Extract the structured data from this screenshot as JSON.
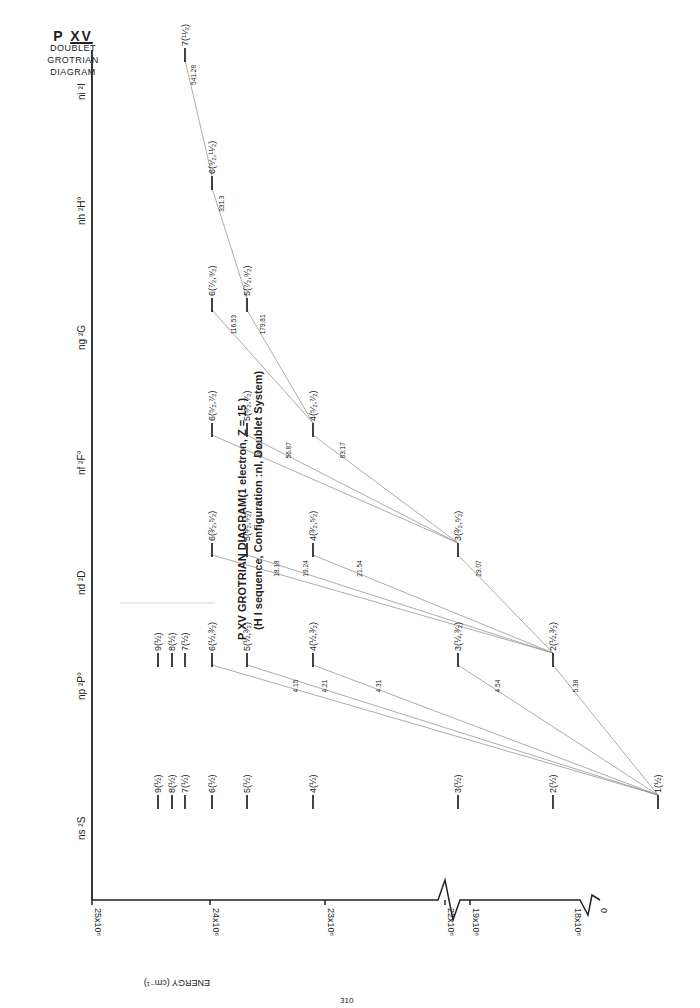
{
  "corner_label": {
    "element": "P",
    "ion": "XV",
    "line1": "DOUBLET",
    "line2": "GROTRIAN",
    "line3": "DIAGRAM"
  },
  "title": {
    "line1": "P XV GROTRIAN DIAGRAM(1 electron, Z = 15 )",
    "line2": "(H I sequence, Configuration :nl, Doublet System)"
  },
  "energy_axis": {
    "label": "ENERGY (cm⁻¹)",
    "ticks": [
      "25x10⁶",
      "24x10⁶",
      "23x10⁶",
      "22x10⁶",
      "19x10⁶",
      "18x10⁶",
      "0"
    ]
  },
  "series_headers": [
    "ns ²S",
    "np ²P°",
    "nd ²D",
    "nf ²F°",
    "ng ²G",
    "nh ²H°",
    "ni ²I"
  ],
  "chart_data": {
    "type": "grotrian",
    "ylabel": "ENERGY (cm^-1)",
    "y_ticks": [
      "0",
      "18x10^6",
      "19x10^6",
      "22x10^6",
      "23x10^6",
      "24x10^6",
      "25x10^6"
    ],
    "axis_breaks": [
      "between 0 and 18x10^6",
      "between 19x10^6 and 22x10^6"
    ],
    "columns": [
      "ns 2S",
      "np 2P°",
      "nd 2D",
      "nf 2F°",
      "ng 2G",
      "nh 2H°",
      "ni 2I"
    ],
    "levels": {
      "ns 2S": [
        "1(1/2)",
        "2(1/2)",
        "3(1/2)",
        "4(1/2)",
        "5(1/2)",
        "6(1/2)",
        "7(1/2)",
        "8(1/2)",
        "9(1/2)"
      ],
      "np 2P°": [
        "2(1/2,3/2)",
        "3(1/2,3/2)",
        "4(1/2,3/2)",
        "5(1/2,3/2)",
        "6(1/2,3/2)",
        "7(1/2)",
        "8(1/2)",
        "9(1/2)"
      ],
      "nd 2D": [
        "3(3/2,5/2)",
        "4(3/2,5/2)",
        "5(3/2,5/2)",
        "6(3/2,5/2)"
      ],
      "nf 2F°": [
        "4(5/2,7/2)",
        "5(5/2,7/2)",
        "6(5/2,7/2)"
      ],
      "ng 2G": [
        "5(7/2,9/2)",
        "6(7/2,9/2)"
      ],
      "nh 2H°": [
        "6(9/2,11/2)"
      ],
      "ni 2I": [
        "7(11/2)"
      ]
    },
    "transitions_wavelength_A": [
      {
        "from": "np 2",
        "to": "ns 1",
        "value": 5.38
      },
      {
        "from": "np 3",
        "to": "ns 2",
        "value": 4.54
      },
      {
        "from": "np 4",
        "to": "ns",
        "value": 4.31
      },
      {
        "from": "np 5",
        "to": "ns",
        "value": 4.21
      },
      {
        "from": "np 6",
        "to": "ns",
        "value": 4.15
      },
      {
        "from": "nd 3",
        "to": "np 2",
        "value": 29.07
      },
      {
        "from": "nd 4",
        "to": "np",
        "value": 21.54
      },
      {
        "from": "nd 5",
        "to": "np",
        "value": 19.24
      },
      {
        "from": "nd 6",
        "to": "np",
        "value": 18.18
      },
      {
        "from": "nf 4",
        "to": "nd 3",
        "value": 83.17
      },
      {
        "from": "nf 5",
        "to": "nd",
        "value": 56.87
      },
      {
        "from": "nf 6",
        "to": "nd",
        "value": 48.53
      },
      {
        "from": "ng 5",
        "to": "nf 4",
        "value": 179.81
      },
      {
        "from": "ng 6",
        "to": "nf",
        "value": 116.53
      },
      {
        "from": "nh 6",
        "to": "ng 5",
        "value": 331.3
      },
      {
        "from": "ni 7",
        "to": "nh 6",
        "value": 541.28
      }
    ]
  },
  "levels_view": [
    {
      "id": "s1",
      "x": 658,
      "y": 797,
      "label": "1(½)"
    },
    {
      "id": "s2",
      "x": 553,
      "y": 797,
      "label": "2(½)"
    },
    {
      "id": "s3",
      "x": 458,
      "y": 797,
      "label": "3(½)"
    },
    {
      "id": "s4",
      "x": 313,
      "y": 797,
      "label": "4(½)"
    },
    {
      "id": "s5",
      "x": 247,
      "y": 797,
      "label": "5(½)"
    },
    {
      "id": "s6",
      "x": 212,
      "y": 797,
      "label": "6(½)"
    },
    {
      "id": "s7",
      "x": 185,
      "y": 797,
      "label": "7(½)"
    },
    {
      "id": "s8",
      "x": 172,
      "y": 797,
      "label": "8(½)"
    },
    {
      "id": "s9",
      "x": 158,
      "y": 797,
      "label": "9(½)"
    },
    {
      "id": "p2",
      "x": 553,
      "y": 655,
      "label": "2(½,³⁄₂)"
    },
    {
      "id": "p3",
      "x": 458,
      "y": 655,
      "label": "3(½,³⁄₂)"
    },
    {
      "id": "p4",
      "x": 313,
      "y": 655,
      "label": "4(½,³⁄₂)"
    },
    {
      "id": "p5",
      "x": 247,
      "y": 655,
      "label": "5(½,³⁄₂)"
    },
    {
      "id": "p6",
      "x": 212,
      "y": 655,
      "label": "6(½,³⁄₂)"
    },
    {
      "id": "p7",
      "x": 185,
      "y": 655,
      "label": "7(½)"
    },
    {
      "id": "p8",
      "x": 172,
      "y": 655,
      "label": "8(½)"
    },
    {
      "id": "p9",
      "x": 158,
      "y": 655,
      "label": "9(½)"
    },
    {
      "id": "d3",
      "x": 458,
      "y": 545,
      "label": "3(³⁄₂,⁵⁄₂)"
    },
    {
      "id": "d4",
      "x": 313,
      "y": 545,
      "label": "4(³⁄₂,⁵⁄₂)"
    },
    {
      "id": "d5",
      "x": 247,
      "y": 545,
      "label": "5(³⁄₂,⁵⁄₂)"
    },
    {
      "id": "d6",
      "x": 212,
      "y": 545,
      "label": "6(³⁄₂,⁵⁄₂)"
    },
    {
      "id": "f4",
      "x": 313,
      "y": 425,
      "label": "4(⁵⁄₂,⁷⁄₂)"
    },
    {
      "id": "f5",
      "x": 247,
      "y": 425,
      "label": "5(⁵⁄₂,⁷⁄₂)"
    },
    {
      "id": "f6",
      "x": 212,
      "y": 425,
      "label": "6(⁵⁄₂,⁷⁄₂)"
    },
    {
      "id": "g5",
      "x": 247,
      "y": 300,
      "label": "5(⁷⁄₂,⁹⁄₂)"
    },
    {
      "id": "g6",
      "x": 212,
      "y": 300,
      "label": "6(⁷⁄₂,⁹⁄₂)"
    },
    {
      "id": "h6",
      "x": 212,
      "y": 178,
      "label": "6(⁹⁄₂,¹¹⁄₂)"
    },
    {
      "id": "i7",
      "x": 185,
      "y": 50,
      "label": "7(¹¹⁄₂)"
    }
  ],
  "transitions_view": [
    {
      "a": "p2",
      "b": "s1",
      "label": "5.38"
    },
    {
      "a": "p3",
      "b": "s1",
      "label": "4.54"
    },
    {
      "a": "p4",
      "b": "s1",
      "label": "4.31"
    },
    {
      "a": "p5",
      "b": "s1",
      "label": "4.21"
    },
    {
      "a": "p6",
      "b": "s1",
      "label": "4.15"
    },
    {
      "a": "d3",
      "b": "p2",
      "label": "29.07"
    },
    {
      "a": "d4",
      "b": "p2",
      "label": "21.54"
    },
    {
      "a": "d5",
      "b": "p2",
      "label": "19.24"
    },
    {
      "a": "d6",
      "b": "p2",
      "label": "18.18"
    },
    {
      "a": "f4",
      "b": "d3",
      "label": "83.17"
    },
    {
      "a": "f5",
      "b": "d3",
      "label": "56.87"
    },
    {
      "a": "f6",
      "b": "d3",
      "label": "48.53"
    },
    {
      "a": "g5",
      "b": "f4",
      "label": "179.81"
    },
    {
      "a": "g6",
      "b": "f4",
      "label": "116.53"
    },
    {
      "a": "h6",
      "b": "g5",
      "label": "331.3"
    },
    {
      "a": "i7",
      "b": "h6",
      "label": "541.28"
    }
  ],
  "page_number": "310"
}
